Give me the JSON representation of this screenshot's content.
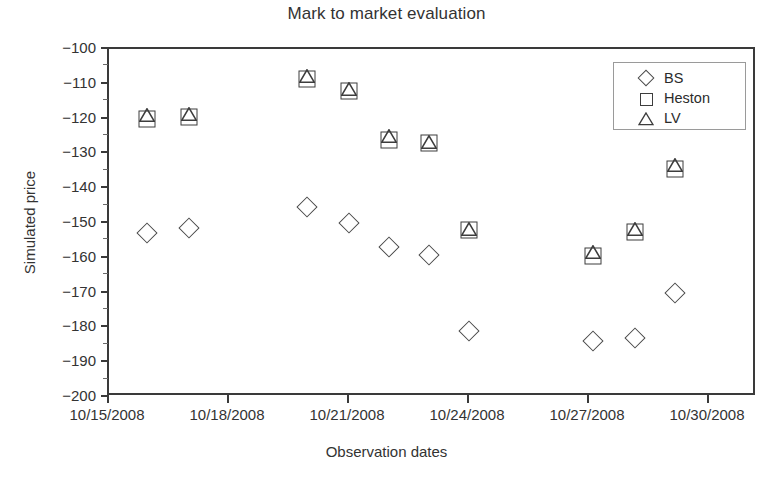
{
  "chart_data": {
    "type": "scatter",
    "title": "Mark to market evaluation",
    "xlabel": "Observation dates",
    "ylabel": "Simulated price",
    "grid": false,
    "legend_position": "top-right",
    "ylim": [
      -200,
      -100
    ],
    "ytick_labels": [
      "−100",
      "−110",
      "−120",
      "−130",
      "−140",
      "−150",
      "−160",
      "−170",
      "−180",
      "−190",
      "−200"
    ],
    "ytick_values": [
      -100,
      -110,
      -120,
      -130,
      -140,
      -150,
      -160,
      -170,
      -180,
      -190,
      -200
    ],
    "xtick_labels": [
      "10/15/2008",
      "10/18/2008",
      "10/21/2008",
      "10/24/2008",
      "10/27/2008",
      "10/30/2008"
    ],
    "xtick_values": [
      0,
      3,
      6,
      9,
      12,
      15
    ],
    "xlim": [
      0,
      16.2
    ],
    "x": [
      1.0,
      2.05,
      5.0,
      6.05,
      7.05,
      8.05,
      9.05,
      12.15,
      13.2,
      14.2
    ],
    "series": [
      {
        "name": "BS",
        "marker": "diamond",
        "color": "#4a4a4a",
        "values": [
          -153.5,
          -152.0,
          -146.0,
          -150.5,
          -157.5,
          -159.8,
          -181.5,
          -184.5,
          -183.5,
          -170.7
        ]
      },
      {
        "name": "Heston",
        "marker": "square",
        "color": "#3d3d3d",
        "values": [
          -120.6,
          -120.0,
          -109.3,
          -112.5,
          -126.8,
          -127.6,
          -152.6,
          -160.0,
          -153.2,
          -135.2
        ]
      },
      {
        "name": "LV",
        "marker": "triangle",
        "color": "#3d3d3d",
        "values": [
          -119.6,
          -119.2,
          -108.3,
          -112.2,
          -125.7,
          -127.4,
          -152.3,
          -159.0,
          -152.4,
          -134.0
        ]
      }
    ],
    "legend_entries": [
      {
        "label": "BS",
        "marker": "diamond"
      },
      {
        "label": "Heston",
        "marker": "square"
      },
      {
        "label": "LV",
        "marker": "triangle"
      }
    ]
  }
}
